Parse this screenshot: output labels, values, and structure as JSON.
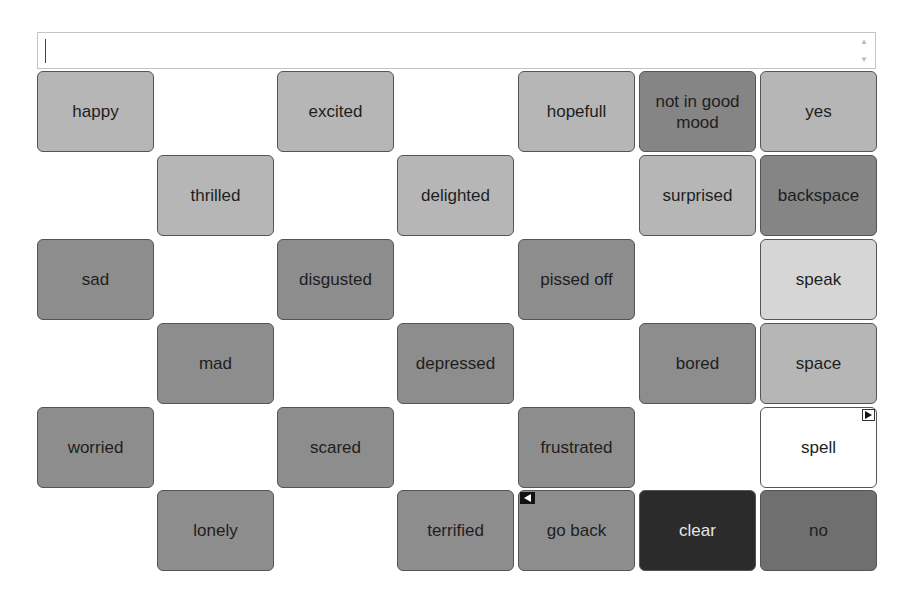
{
  "input": {
    "value": "",
    "scroll_up_icon": "▲",
    "scroll_down_icon": "▼"
  },
  "colors": {
    "light": "#b6b6b6",
    "lighter": "#d6d6d6",
    "medium": "#8d8d8d",
    "medium_dark": "#858585",
    "dark": "#6f6f6f",
    "darkest": "#2b2b2b",
    "white": "#ffffff"
  },
  "grid": {
    "columns": 7,
    "rows": 6,
    "cells": [
      {
        "id": "happy",
        "label": "happy",
        "row": 0,
        "col": 0,
        "color": "light"
      },
      {
        "id": "excited",
        "label": "excited",
        "row": 0,
        "col": 2,
        "color": "light"
      },
      {
        "id": "hopefull",
        "label": "hopefull",
        "row": 0,
        "col": 4,
        "color": "light"
      },
      {
        "id": "not-in-good-mood",
        "label": "not in good mood",
        "row": 0,
        "col": 5,
        "color": "medium_dark"
      },
      {
        "id": "yes",
        "label": "yes",
        "row": 0,
        "col": 6,
        "color": "light"
      },
      {
        "id": "thrilled",
        "label": "thrilled",
        "row": 1,
        "col": 1,
        "color": "light"
      },
      {
        "id": "delighted",
        "label": "delighted",
        "row": 1,
        "col": 3,
        "color": "light"
      },
      {
        "id": "surprised",
        "label": "surprised",
        "row": 1,
        "col": 5,
        "color": "light"
      },
      {
        "id": "backspace",
        "label": "backspace",
        "row": 1,
        "col": 6,
        "color": "medium_dark"
      },
      {
        "id": "sad",
        "label": "sad",
        "row": 2,
        "col": 0,
        "color": "medium"
      },
      {
        "id": "disgusted",
        "label": "disgusted",
        "row": 2,
        "col": 2,
        "color": "medium"
      },
      {
        "id": "pissed-off",
        "label": "pissed off",
        "row": 2,
        "col": 4,
        "color": "medium"
      },
      {
        "id": "speak",
        "label": "speak",
        "row": 2,
        "col": 6,
        "color": "lighter"
      },
      {
        "id": "mad",
        "label": "mad",
        "row": 3,
        "col": 1,
        "color": "medium"
      },
      {
        "id": "depressed",
        "label": "depressed",
        "row": 3,
        "col": 3,
        "color": "medium"
      },
      {
        "id": "bored",
        "label": "bored",
        "row": 3,
        "col": 5,
        "color": "medium"
      },
      {
        "id": "space",
        "label": "space",
        "row": 3,
        "col": 6,
        "color": "light"
      },
      {
        "id": "worried",
        "label": "worried",
        "row": 4,
        "col": 0,
        "color": "medium"
      },
      {
        "id": "scared",
        "label": "scared",
        "row": 4,
        "col": 2,
        "color": "medium"
      },
      {
        "id": "frustrated",
        "label": "frustrated",
        "row": 4,
        "col": 4,
        "color": "medium"
      },
      {
        "id": "spell",
        "label": "spell",
        "row": 4,
        "col": 6,
        "color": "white",
        "corner": "right"
      },
      {
        "id": "lonely",
        "label": "lonely",
        "row": 5,
        "col": 1,
        "color": "medium"
      },
      {
        "id": "terrified",
        "label": "terrified",
        "row": 5,
        "col": 3,
        "color": "medium"
      },
      {
        "id": "go-back",
        "label": "go back",
        "row": 5,
        "col": 4,
        "color": "medium",
        "corner": "left"
      },
      {
        "id": "clear",
        "label": "clear",
        "row": 5,
        "col": 5,
        "color": "darkest",
        "text_color": "#e6e6e6"
      },
      {
        "id": "no",
        "label": "no",
        "row": 5,
        "col": 6,
        "color": "dark"
      }
    ]
  }
}
